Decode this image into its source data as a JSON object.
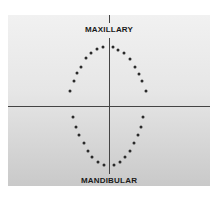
{
  "diagram": {
    "labels": {
      "top": "MAXILLARY",
      "bottom": "MANDIBULAR"
    },
    "axes": {
      "horizontal_y": 106,
      "vertical_x": 109
    },
    "colors": {
      "background": "#e6e6e6",
      "line": "#444444",
      "dot": "#2a2a2a",
      "text": "#1a1a1a"
    },
    "maxillary_points": [
      [
        70,
        91
      ],
      [
        74,
        81
      ],
      [
        77,
        73
      ],
      [
        81,
        67
      ],
      [
        86,
        58
      ],
      [
        91,
        53
      ],
      [
        97,
        49
      ],
      [
        103,
        47
      ],
      [
        113,
        47
      ],
      [
        118,
        50
      ],
      [
        124,
        53
      ],
      [
        130,
        59
      ],
      [
        135,
        67
      ],
      [
        139,
        74
      ],
      [
        142,
        81
      ],
      [
        146,
        91
      ]
    ],
    "mandibular_points": [
      [
        73,
        117
      ],
      [
        76,
        127
      ],
      [
        79,
        135
      ],
      [
        84,
        143
      ],
      [
        88,
        151
      ],
      [
        92,
        157
      ],
      [
        98,
        162
      ],
      [
        104,
        165
      ],
      [
        114,
        165
      ],
      [
        120,
        162
      ],
      [
        125,
        157
      ],
      [
        130,
        151
      ],
      [
        134,
        143
      ],
      [
        138,
        135
      ],
      [
        141,
        127
      ],
      [
        143,
        117
      ]
    ]
  }
}
